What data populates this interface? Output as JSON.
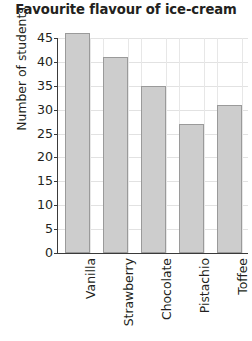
{
  "chart_data": {
    "type": "bar",
    "title": "Favourite flavour of ice-cream",
    "xlabel": "",
    "ylabel": "Number of students",
    "categories": [
      "Vanilla",
      "Strawberry",
      "Chocolate",
      "Pistachio",
      "Toffee"
    ],
    "values": [
      46,
      41,
      35,
      27,
      31
    ],
    "ylim": [
      0,
      45
    ],
    "ytick_step": 5,
    "yticks": [
      0,
      5,
      10,
      15,
      20,
      25,
      30,
      35,
      40,
      45
    ],
    "ytick_labels": [
      "0",
      "5",
      "10",
      "15",
      "20",
      "25",
      "30",
      "35",
      "40",
      "45"
    ],
    "grid": true,
    "legend": false,
    "bar_fill_color": "#cdcdcd",
    "bar_border_color": "#9a9a9a",
    "axis_color": "#3a3a3a",
    "grid_color": "#e2e2e2",
    "text_color": "#231f20"
  }
}
